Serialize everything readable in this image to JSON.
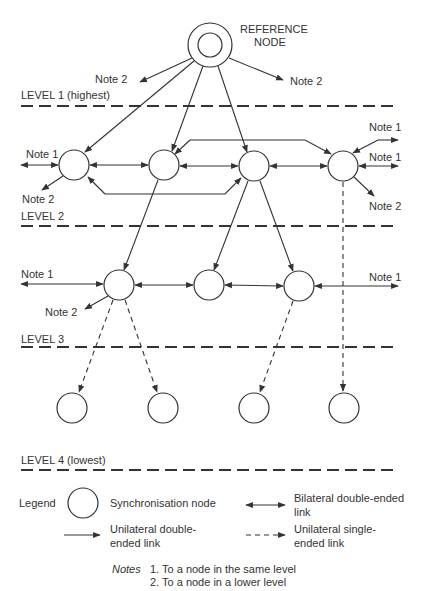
{
  "page_number": "",
  "reference_node": {
    "label_line1": "REFERENCE",
    "label_line2": "NODE"
  },
  "levels": [
    {
      "label": "LEVEL 1 (highest)"
    },
    {
      "label": "LEVEL 2"
    },
    {
      "label": "LEVEL 3"
    },
    {
      "label": "LEVEL 4 (lowest)"
    }
  ],
  "notes_labels": {
    "note1": "Note 1",
    "note2": "Note 2"
  },
  "legend": {
    "title": "Legend",
    "sync_node": "Synchronisation node",
    "bilateral_line1": "Bilateral double-ended",
    "bilateral_line2": "link",
    "unilateral_double_line1": "Unilateral double-",
    "unilateral_double_line2": "ended link",
    "unilateral_single_line1": "Unilateral single-",
    "unilateral_single_line2": "ended link"
  },
  "notes": {
    "title": "Notes",
    "items": [
      "1. To a node in the same level",
      "2. To a node in a lower level"
    ]
  },
  "colors": {
    "ink": "#333333",
    "background": "#ffffff"
  }
}
